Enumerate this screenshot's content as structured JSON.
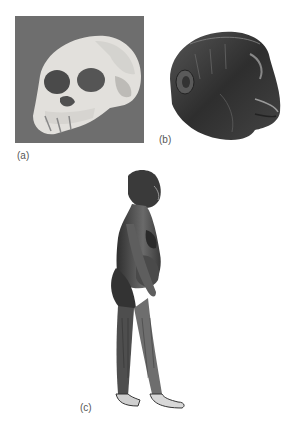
{
  "figure": {
    "panels": [
      {
        "id": "a",
        "label": "(a)",
        "content": "fossil skull photograph"
      },
      {
        "id": "b",
        "label": "(b)",
        "content": "reconstructed head sculpture"
      },
      {
        "id": "c",
        "label": "(c)",
        "content": "full-body reconstruction drawing, standing profile"
      }
    ]
  },
  "colors": {
    "photo_bg": "#6e6e6e",
    "bone": "#e4e2de",
    "skin_dark": "#3a3a3a",
    "skin_mid": "#6a6a6a"
  }
}
